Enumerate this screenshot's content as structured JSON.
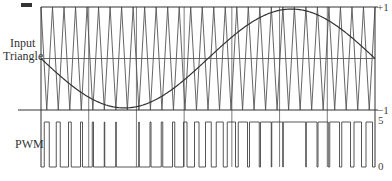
{
  "chart_data": {
    "type": "line",
    "title": "",
    "panels": [
      {
        "name": "input-triangle",
        "label_lines": [
          "Input",
          "Triangle"
        ],
        "ylim": [
          -1,
          1
        ],
        "tick_labels": [
          "+1",
          "-1"
        ],
        "series": [
          {
            "name": "Triangle carrier",
            "kind": "triangle",
            "periods": 29,
            "amplitude": 1
          },
          {
            "name": "Input sine",
            "kind": "sine",
            "cycles": 1,
            "amplitude": 0.96,
            "phase_deg": 180
          }
        ]
      },
      {
        "name": "pwm",
        "label": "PWM",
        "ylim": [
          0,
          5
        ],
        "tick_labels": [
          "5",
          "0"
        ],
        "series": [
          {
            "name": "PWM output",
            "kind": "square",
            "high": 5,
            "low": 0
          }
        ]
      }
    ],
    "xlabel": "",
    "ylabel": "",
    "grid": true,
    "vertical_grid_count": 6,
    "legend": "none"
  },
  "labels": {
    "input_line1": "Input",
    "input_line2": "Triangle",
    "pwm": "PWM",
    "plus_one": "+1",
    "minus_one": "−1",
    "five": "5",
    "zero": "0"
  },
  "colors": {
    "line": "#333333",
    "triangle": "#555555",
    "grid": "#444444",
    "pwm": "#444444"
  }
}
